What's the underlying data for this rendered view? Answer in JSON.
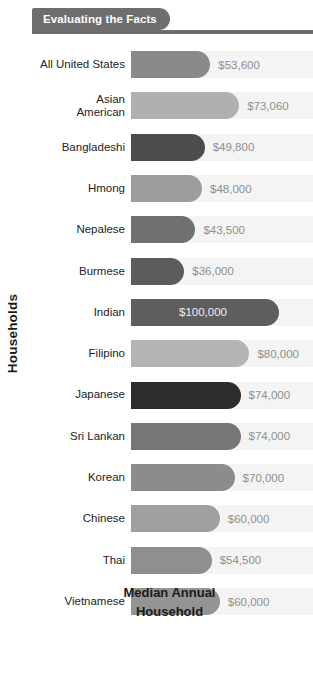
{
  "header": {
    "tab_label": "Evaluating the Facts",
    "tab_color": "#6e6e6e"
  },
  "chart_data": {
    "type": "bar",
    "orientation": "horizontal",
    "title": "Evaluating the Facts",
    "xlabel": "Median Annual Household",
    "xlabel_line1": "Median Annual",
    "xlabel_line2": "Household",
    "ylabel": "Households",
    "grid": false,
    "legend": "none",
    "xlim": [
      0,
      100000
    ],
    "value_prefix": "$",
    "categories": [
      "All United States",
      "Asian American",
      "Bangladeshi",
      "Hmong",
      "Nepalese",
      "Burmese",
      "Indian",
      "Filipino",
      "Japanese",
      "Sri Lankan",
      "Korean",
      "Chinese",
      "Thai",
      "Vietnamese"
    ],
    "values": [
      53600,
      73060,
      49800,
      48000,
      43500,
      36000,
      100000,
      80000,
      74000,
      74000,
      70000,
      60000,
      54500,
      60000
    ],
    "value_labels": [
      "$53,600",
      "$73,060",
      "$49,800",
      "$48,000",
      "$43,500",
      "$36,000",
      "$100,000",
      "$80,000",
      "$74,000",
      "$74,000",
      "$70,000",
      "$60,000",
      "$54,500",
      "$60,000"
    ],
    "bar_colors": [
      "#8a8a8a",
      "#b0b0b0",
      "#4c4c4c",
      "#9d9d9d",
      "#707070",
      "#5c5c5c",
      "#5e5e5e",
      "#b4b4b4",
      "#2c2c2c",
      "#767676",
      "#8c8c8c",
      "#a0a0a0",
      "#8f8f8f",
      "#949494"
    ],
    "label_inside": [
      false,
      false,
      false,
      false,
      false,
      false,
      true,
      false,
      false,
      false,
      false,
      false,
      false,
      false
    ],
    "track_color": "#f4f4f4",
    "value_text_color": "#8f8f8f",
    "value_text_color_inside": "#eeeeee"
  },
  "rows": [
    {
      "label": "All United States",
      "label_line1": "All United States",
      "label_line2": "",
      "value_label": "$53,600"
    },
    {
      "label": "Asian American",
      "label_line1": "Asian",
      "label_line2": "American",
      "value_label": "$73,060"
    },
    {
      "label": "Bangladeshi",
      "label_line1": "Bangladeshi",
      "label_line2": "",
      "value_label": "$49,800"
    },
    {
      "label": "Hmong",
      "label_line1": "Hmong",
      "label_line2": "",
      "value_label": "$48,000"
    },
    {
      "label": "Nepalese",
      "label_line1": "Nepalese",
      "label_line2": "",
      "value_label": "$43,500"
    },
    {
      "label": "Burmese",
      "label_line1": "Burmese",
      "label_line2": "",
      "value_label": "$36,000"
    },
    {
      "label": "Indian",
      "label_line1": "Indian",
      "label_line2": "",
      "value_label": "$100,000"
    },
    {
      "label": "Filipino",
      "label_line1": "Filipino",
      "label_line2": "",
      "value_label": "$80,000"
    },
    {
      "label": "Japanese",
      "label_line1": "Japanese",
      "label_line2": "",
      "value_label": "$74,000"
    },
    {
      "label": "Sri Lankan",
      "label_line1": "Sri Lankan",
      "label_line2": "",
      "value_label": "$74,000"
    },
    {
      "label": "Korean",
      "label_line1": "Korean",
      "label_line2": "",
      "value_label": "$70,000"
    },
    {
      "label": "Chinese",
      "label_line1": "Chinese",
      "label_line2": "",
      "value_label": "$60,000"
    },
    {
      "label": "Thai",
      "label_line1": "Thai",
      "label_line2": "",
      "value_label": "$54,500"
    },
    {
      "label": "Vietnamese",
      "label_line1": "Vietnamese",
      "label_line2": "",
      "value_label": "$60,000"
    }
  ]
}
